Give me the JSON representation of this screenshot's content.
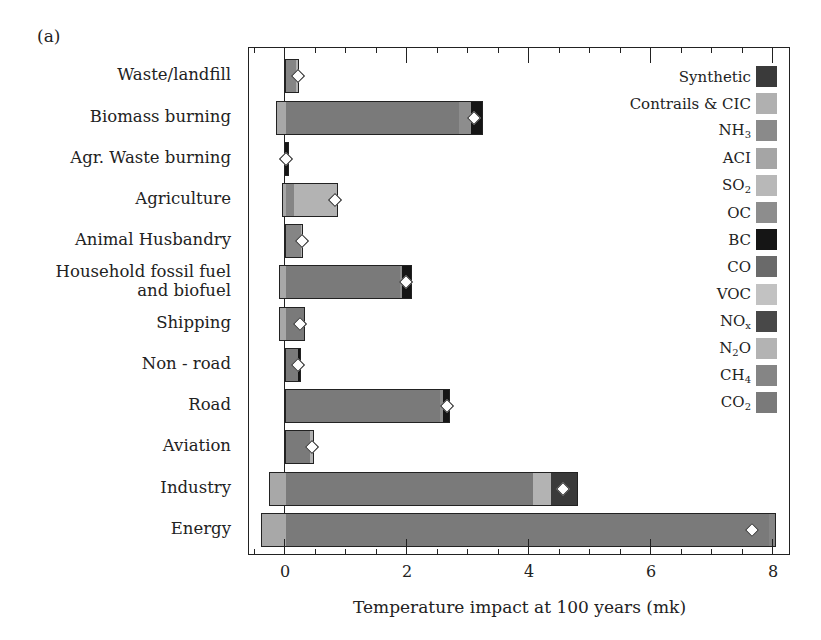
{
  "panel_label": "(a)",
  "colors": {
    "CO2": "#7a7a7a",
    "CH4": "#858585",
    "N2O": "#b3b3b3",
    "NOx": "#484848",
    "VOC": "#c2c2c2",
    "CO": "#6a6a6a",
    "BC": "#151515",
    "OC": "#8d8d8d",
    "SO2": "#b8b8b8",
    "ACI": "#a5a5a5",
    "NH3": "#8a8a8a",
    "Contrails": "#b0b0b0",
    "Synthetic": "#3a3a3a",
    "light_negative": "#a8a8a8"
  },
  "legend": [
    {
      "key": "Synthetic",
      "label": "Synthetic",
      "sub": "",
      "suffix": ""
    },
    {
      "key": "Contrails",
      "label": "Contrails & CIC",
      "sub": "",
      "suffix": ""
    },
    {
      "key": "NH3",
      "label": "NH",
      "sub": "3",
      "suffix": ""
    },
    {
      "key": "ACI",
      "label": "ACI",
      "sub": "",
      "suffix": ""
    },
    {
      "key": "SO2",
      "label": "SO",
      "sub": "2",
      "suffix": ""
    },
    {
      "key": "OC",
      "label": "OC",
      "sub": "",
      "suffix": ""
    },
    {
      "key": "BC",
      "label": "BC",
      "sub": "",
      "suffix": ""
    },
    {
      "key": "CO",
      "label": "CO",
      "sub": "",
      "suffix": ""
    },
    {
      "key": "VOC",
      "label": "VOC",
      "sub": "",
      "suffix": ""
    },
    {
      "key": "NOx",
      "label": "NO",
      "sub": "x",
      "suffix": ""
    },
    {
      "key": "N2O",
      "label": "N",
      "sub": "2",
      "suffix": "O"
    },
    {
      "key": "CH4",
      "label": "CH",
      "sub": "4",
      "suffix": ""
    },
    {
      "key": "CO2",
      "label": "CO",
      "sub": "2",
      "suffix": ""
    }
  ],
  "chart_data": {
    "type": "bar",
    "orientation": "horizontal-stacked",
    "title": "",
    "panel": "(a)",
    "xlabel": "Temperature impact at 100 years (mk)",
    "ylabel": "",
    "xlim": [
      -0.6,
      8.3
    ],
    "xticks_major": [
      0,
      2,
      4,
      6,
      8
    ],
    "xticks_minor_step": 0.5,
    "grid": false,
    "legend_position": "upper right (inside)",
    "categories": [
      "Waste/landfill",
      "Biomass burning",
      "Agr. Waste burning",
      "Agriculture",
      "Animal Husbandry",
      "Household fossil fuel and biofuel",
      "Shipping",
      "Non - road",
      "Road",
      "Aviation",
      "Industry",
      "Energy"
    ],
    "bars": [
      {
        "category": "Waste/landfill",
        "negative": 0,
        "segments": [
          {
            "key": "CH4",
            "value": 0.2
          },
          {
            "key": "N2O",
            "value": 0.03
          }
        ],
        "net": 0.22
      },
      {
        "category": "Biomass burning",
        "negative": -0.15,
        "segments": [
          {
            "key": "CO2",
            "value": 2.87
          },
          {
            "key": "OC",
            "value": 0.2
          },
          {
            "key": "BC",
            "value": 0.18
          }
        ],
        "net": 3.1
      },
      {
        "category": "Agr. Waste burning",
        "negative": -0.02,
        "segments": [
          {
            "key": "BC",
            "value": 0.06
          }
        ],
        "net": 0.02
      },
      {
        "category": "Agriculture",
        "negative": -0.05,
        "segments": [
          {
            "key": "CH4",
            "value": 0.13
          },
          {
            "key": "N2O",
            "value": 0.74
          }
        ],
        "net": 0.82
      },
      {
        "category": "Animal Husbandry",
        "negative": 0,
        "segments": [
          {
            "key": "CH4",
            "value": 0.27
          },
          {
            "key": "N2O",
            "value": 0.03
          }
        ],
        "net": 0.28
      },
      {
        "category": "Household fossil fuel and biofuel",
        "negative": -0.1,
        "segments": [
          {
            "key": "CO2",
            "value": 1.9
          },
          {
            "key": "OC",
            "value": 0.03
          },
          {
            "key": "BC",
            "value": 0.15
          }
        ],
        "net": 1.98
      },
      {
        "category": "Shipping",
        "negative": -0.1,
        "segments": [
          {
            "key": "CO2",
            "value": 0.32
          }
        ],
        "net": 0.25
      },
      {
        "category": "Non - road",
        "negative": 0,
        "segments": [
          {
            "key": "CO2",
            "value": 0.22
          },
          {
            "key": "BC",
            "value": 0.04
          }
        ],
        "net": 0.22
      },
      {
        "category": "Road",
        "negative": 0,
        "segments": [
          {
            "key": "CO2",
            "value": 2.56
          },
          {
            "key": "OC",
            "value": 0.05
          },
          {
            "key": "BC",
            "value": 0.09
          }
        ],
        "net": 2.65
      },
      {
        "category": "Aviation",
        "negative": 0,
        "segments": [
          {
            "key": "CO2",
            "value": 0.42
          },
          {
            "key": "Contrails",
            "value": 0.05
          }
        ],
        "net": 0.45
      },
      {
        "category": "Industry",
        "negative": -0.27,
        "segments": [
          {
            "key": "CO2",
            "value": 4.07
          },
          {
            "key": "N2O",
            "value": 0.31
          },
          {
            "key": "Synthetic",
            "value": 0.42
          }
        ],
        "net": 4.55
      },
      {
        "category": "Energy",
        "negative": -0.4,
        "segments": [
          {
            "key": "CO2",
            "value": 7.95
          },
          {
            "key": "CH4",
            "value": 0.1
          }
        ],
        "net": 7.65
      }
    ]
  }
}
